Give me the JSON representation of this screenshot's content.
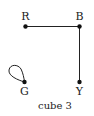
{
  "diagram": {
    "caption": "cube 3",
    "nodes": [
      {
        "id": "R",
        "label": "R",
        "x": 25.5,
        "y": 26.5
      },
      {
        "id": "B",
        "label": "B",
        "x": 79.5,
        "y": 26.5
      },
      {
        "id": "G",
        "label": "G",
        "x": 24.5,
        "y": 82
      },
      {
        "id": "Y",
        "label": "Y",
        "x": 79.5,
        "y": 82
      }
    ],
    "edges": [
      {
        "from": "R",
        "to": "B"
      },
      {
        "from": "B",
        "to": "Y"
      },
      {
        "from": "G",
        "to": "G",
        "type": "loop"
      }
    ],
    "colors": {
      "stroke": "#222222",
      "node": "#111111",
      "background": "#ffffff"
    }
  }
}
